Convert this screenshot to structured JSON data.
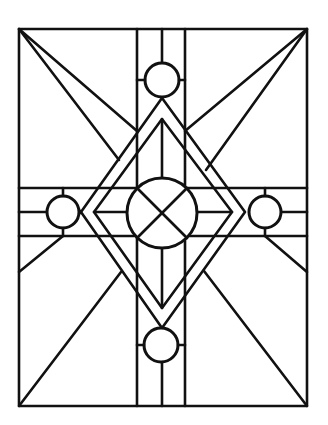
{
  "artwork": {
    "title": "",
    "description": "Stained glass line-art pattern: rectangular frame with cross bands, nested diamonds, four small circles and a central circle with an X",
    "colors": {
      "line": "#111111",
      "background": "#ffffff"
    }
  }
}
